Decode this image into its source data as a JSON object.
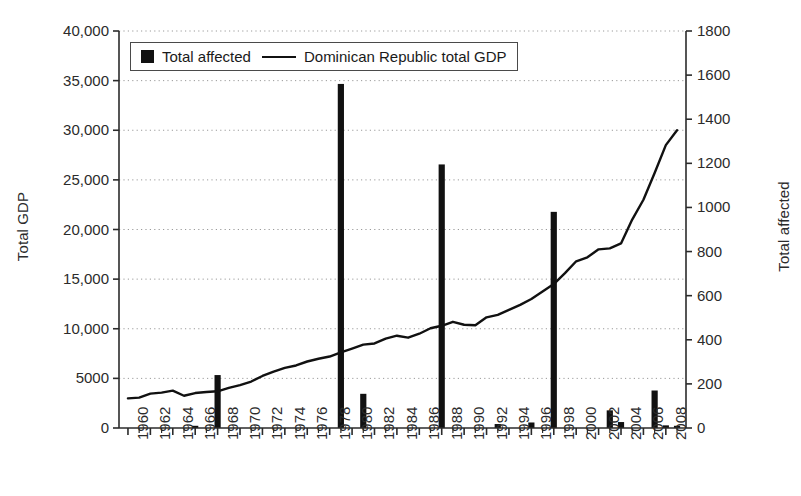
{
  "chart_data": {
    "type": "bar",
    "title": "",
    "xlabel": "",
    "ylabel": "Total GDP",
    "ylabel_secondary": "Total affected",
    "grid": "horizontal-dotted",
    "legend_position": "top-left-inside",
    "xlim": [
      1959.2,
      2009.8
    ],
    "ylim": [
      0,
      40000
    ],
    "ylim_secondary": [
      0,
      1800
    ],
    "ytick_labels": [
      "0",
      "5000",
      "10,000",
      "15,000",
      "20,000",
      "25,000",
      "30,000",
      "35,000",
      "40,000"
    ],
    "ytick_values": [
      0,
      5000,
      10000,
      15000,
      20000,
      25000,
      30000,
      35000,
      40000
    ],
    "ytick_labels_secondary": [
      "0",
      "200",
      "400",
      "600",
      "800",
      "1000",
      "1200",
      "1400",
      "1600",
      "1800"
    ],
    "ytick_values_secondary": [
      0,
      200,
      400,
      600,
      800,
      1000,
      1200,
      1400,
      1600,
      1800
    ],
    "xtick_labels": [
      "1960",
      "1962",
      "1964",
      "1966",
      "1968",
      "1970",
      "1972",
      "1974",
      "1976",
      "1978",
      "1980",
      "1982",
      "1984",
      "1986",
      "1988",
      "1990",
      "1992",
      "1994",
      "1996",
      "1998",
      "2000",
      "2002",
      "2004",
      "2006",
      "2008"
    ],
    "xtick_values": [
      1960,
      1962,
      1964,
      1966,
      1968,
      1970,
      1972,
      1974,
      1976,
      1978,
      1980,
      1982,
      1984,
      1986,
      1988,
      1990,
      1992,
      1994,
      1996,
      1998,
      2000,
      2002,
      2004,
      2006,
      2008
    ],
    "x_minor_step": 1,
    "series": [
      {
        "name": "Total affected",
        "type": "bar",
        "axis": "secondary",
        "color": "#111111",
        "x": [
          1960,
          1961,
          1962,
          1963,
          1964,
          1965,
          1966,
          1967,
          1968,
          1969,
          1970,
          1971,
          1972,
          1973,
          1974,
          1975,
          1976,
          1977,
          1978,
          1979,
          1980,
          1981,
          1982,
          1983,
          1984,
          1985,
          1986,
          1987,
          1988,
          1989,
          1990,
          1991,
          1992,
          1993,
          1994,
          1995,
          1996,
          1997,
          1998,
          1999,
          2000,
          2001,
          2002,
          2003,
          2004,
          2005,
          2006,
          2007,
          2008,
          2009
        ],
        "values": [
          0,
          0,
          0,
          0,
          0,
          0,
          10,
          0,
          240,
          0,
          0,
          0,
          0,
          0,
          0,
          0,
          0,
          0,
          0,
          1560,
          0,
          155,
          0,
          0,
          0,
          0,
          0,
          0,
          1195,
          0,
          0,
          0,
          0,
          18,
          0,
          0,
          25,
          0,
          980,
          0,
          0,
          0,
          0,
          80,
          27,
          0,
          0,
          170,
          12,
          10
        ]
      },
      {
        "name": "Dominican Republic total GDP",
        "type": "line",
        "axis": "primary",
        "color": "#111111",
        "x": [
          1960,
          1961,
          1962,
          1963,
          1964,
          1965,
          1966,
          1967,
          1968,
          1969,
          1970,
          1971,
          1972,
          1973,
          1974,
          1975,
          1976,
          1977,
          1978,
          1979,
          1980,
          1981,
          1982,
          1983,
          1984,
          1985,
          1986,
          1987,
          1988,
          1989,
          1990,
          1991,
          1992,
          1993,
          1994,
          1995,
          1996,
          1997,
          1998,
          1999,
          2000,
          2001,
          2002,
          2003,
          2004,
          2005,
          2006,
          2007,
          2008,
          2009
        ],
        "values": [
          2980,
          3060,
          3460,
          3560,
          3760,
          3250,
          3520,
          3620,
          3700,
          4050,
          4320,
          4680,
          5240,
          5680,
          6060,
          6300,
          6700,
          6980,
          7200,
          7620,
          8000,
          8400,
          8520,
          9000,
          9300,
          9100,
          9500,
          10050,
          10300,
          10700,
          10400,
          10350,
          11150,
          11400,
          11900,
          12400,
          13000,
          13750,
          14500,
          15600,
          16800,
          17200,
          18000,
          18100,
          18600,
          21000,
          23000,
          25700,
          28500,
          30000
        ]
      }
    ]
  },
  "legend": {
    "entries": [
      {
        "label": "Total affected",
        "marker": "bar-swatch"
      },
      {
        "label": "Dominican Republic total GDP",
        "marker": "line-swatch"
      }
    ]
  },
  "colors": {
    "ink": "#111111",
    "axis": "#2b2b2b",
    "grid": "#9a9a9a",
    "background": "#ffffff"
  }
}
